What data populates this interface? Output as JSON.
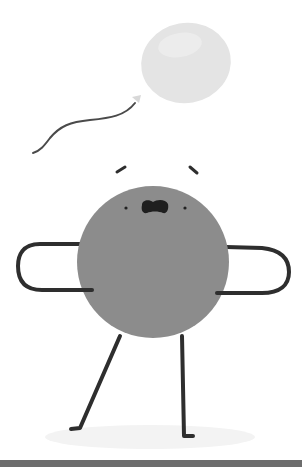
{
  "image": {
    "caption": "Illustration of a round gray character with arms on hips, standing on thin legs, looking surprised as a balloon floats away",
    "style": "grayscale flat illustration"
  },
  "colors": {
    "background": "#ffffff",
    "balloon": "#e4e4e4",
    "balloon_highlight": "#efefef",
    "body": "#8c8c8c",
    "line": "#2e2e2e",
    "shadow": "#f2f2f2",
    "bottom_strip": "#6d6d6d"
  },
  "elements": {
    "balloon": {
      "cx": 186,
      "cy": 63,
      "rx": 45,
      "ry": 40,
      "rotation": -10
    },
    "balloon_knot": {
      "x": 137,
      "y": 100
    },
    "string_end": {
      "x": 33,
      "y": 153
    },
    "eyebrows": [
      {
        "x": 121,
        "y": 169
      },
      {
        "x": 194,
        "y": 170
      }
    ],
    "body": {
      "cx": 152,
      "cy": 258,
      "r": 75
    },
    "eyes": [
      {
        "x": 126,
        "y": 209
      },
      {
        "x": 185,
        "y": 209
      }
    ],
    "mouth": {
      "x": 155,
      "y": 207
    },
    "legs": [
      {
        "from": [
          120,
          338
        ],
        "to": [
          77,
          428
        ],
        "foot_dir": "left"
      },
      {
        "from": [
          183,
          338
        ],
        "to": [
          185,
          437
        ],
        "foot_dir": "right"
      }
    ]
  }
}
